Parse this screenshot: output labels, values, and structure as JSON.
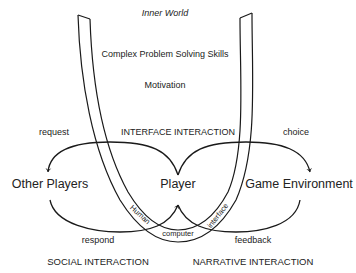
{
  "title": "Inner World",
  "inner": {
    "top_label": "Inner World",
    "skills_label": "Complex Problem Solving Skills",
    "motivation_label": "Motivation"
  },
  "interactions": {
    "interface": "INTERFACE INTERACTION",
    "social": "SOCIAL INTERACTION",
    "narrative": "NARRATIVE INTERACTION"
  },
  "nodes": {
    "other_players": "Other Players",
    "player": "Player",
    "game_environment": "Game Environment"
  },
  "arrows": {
    "request": "request",
    "choice": "choice",
    "respond": "respond",
    "feedback": "feedback"
  },
  "tube_text": {
    "human": "Human",
    "computer": "computer",
    "interface": "interface"
  },
  "colors": {
    "line": "#1a1a1a",
    "text": "#222222",
    "background": "#ffffff"
  }
}
